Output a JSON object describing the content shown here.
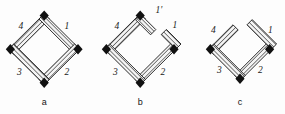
{
  "figure": {
    "background": "#fdfdfd",
    "ink": "#1a1a1a",
    "hatch_color": "#2b2b2b",
    "bar_fill": "#f2f2f2",
    "panels": [
      {
        "id": "a",
        "caption": "a",
        "description": "closed rhombus four-bar linkage, all four bars joined at four pin joints",
        "bars": [
          {
            "name": "bar-1",
            "label": "1"
          },
          {
            "name": "bar-2",
            "label": "2"
          },
          {
            "name": "bar-3",
            "label": "3"
          },
          {
            "name": "bar-4",
            "label": "4"
          }
        ],
        "joints": 4
      },
      {
        "id": "b",
        "caption": "b",
        "description": "rhombus linkage opened at the top-right, bar 1 split into 1 and 1 prime leaving a gap",
        "bars": [
          {
            "name": "bar-1-prime",
            "label": "1'"
          },
          {
            "name": "bar-1",
            "label": "1"
          },
          {
            "name": "bar-2",
            "label": "2"
          },
          {
            "name": "bar-3",
            "label": "3"
          },
          {
            "name": "bar-4",
            "label": "4"
          }
        ],
        "joints": 3
      },
      {
        "id": "c",
        "caption": "c",
        "description": "chevron V configuration, upper bars 4 and 1 detached at the top apex",
        "bars": [
          {
            "name": "bar-1",
            "label": "1"
          },
          {
            "name": "bar-2",
            "label": "2"
          },
          {
            "name": "bar-3",
            "label": "3"
          },
          {
            "name": "bar-4",
            "label": "4"
          }
        ],
        "joints": 3
      }
    ],
    "captions": [
      "a",
      "b",
      "c"
    ]
  }
}
